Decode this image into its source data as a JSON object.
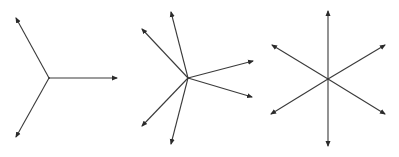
{
  "canvas": {
    "width": 399,
    "height": 157,
    "background": "#ffffff"
  },
  "style": {
    "stroke": "#3a3a3a",
    "stroke_width": 1.1,
    "arrow_color": "#2a2a2a"
  },
  "diagrams": [
    {
      "name": "three-vector-star",
      "center": [
        49,
        78
      ],
      "tips": [
        [
          16,
          18
        ],
        [
          117,
          78
        ],
        [
          16,
          137
        ]
      ]
    },
    {
      "name": "six-vector-irregular-star",
      "center": [
        188,
        78
      ],
      "tips": [
        [
          171,
          12
        ],
        [
          142,
          29
        ],
        [
          253,
          61
        ],
        [
          252,
          97
        ],
        [
          142,
          126
        ],
        [
          171,
          144
        ]
      ]
    },
    {
      "name": "six-vector-regular-star",
      "center": [
        328,
        79
      ],
      "tips": [
        [
          328,
          11
        ],
        [
          272,
          45
        ],
        [
          385,
          45
        ],
        [
          271,
          114
        ],
        [
          385,
          114
        ],
        [
          328,
          146
        ]
      ]
    }
  ]
}
